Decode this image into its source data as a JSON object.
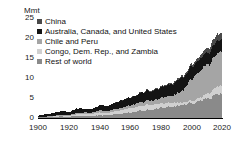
{
  "chart_data": {
    "type": "area",
    "stacked": true,
    "title": "",
    "subtitle": "",
    "xlabel": "",
    "ylabel": "Mmt",
    "unit_label": "Mmt",
    "grid": false,
    "legend_position": "top-left",
    "xlim": [
      1900,
      2020
    ],
    "ylim": [
      0,
      25
    ],
    "xticks": [
      "1900",
      "1920",
      "1940",
      "1960",
      "1980",
      "2000",
      "2020"
    ],
    "yticks": [
      "0",
      "5",
      "10",
      "15",
      "20",
      "25"
    ],
    "x": [
      1900,
      1905,
      1910,
      1915,
      1920,
      1925,
      1930,
      1935,
      1940,
      1945,
      1950,
      1955,
      1960,
      1965,
      1970,
      1975,
      1980,
      1985,
      1990,
      1995,
      2000,
      2005,
      2010,
      2015,
      2018,
      2020
    ],
    "series": [
      {
        "name": "Rest of world",
        "color": "#8a8a8a",
        "values": [
          0.15,
          0.2,
          0.3,
          0.35,
          0.3,
          0.45,
          0.5,
          0.5,
          0.7,
          0.6,
          0.9,
          1.1,
          1.3,
          1.6,
          1.9,
          2.1,
          2.4,
          2.6,
          2.9,
          3.2,
          3.6,
          4.0,
          4.6,
          5.3,
          5.7,
          5.8
        ]
      },
      {
        "name": "Congo, Dem. Rep., and Zambia",
        "color": "#d0d0d0",
        "values": [
          0.0,
          0.02,
          0.05,
          0.1,
          0.2,
          0.35,
          0.5,
          0.45,
          0.6,
          0.55,
          0.7,
          0.85,
          1.0,
          1.1,
          1.25,
          1.2,
          1.1,
          1.05,
          0.9,
          0.6,
          0.55,
          0.7,
          1.1,
          1.6,
          1.9,
          2.0
        ]
      },
      {
        "name": "Chile and Peru",
        "color": "#a5a5a5",
        "values": [
          0.05,
          0.1,
          0.15,
          0.3,
          0.25,
          0.35,
          0.35,
          0.3,
          0.55,
          0.5,
          0.5,
          0.6,
          0.7,
          0.8,
          0.95,
          1.0,
          1.25,
          1.6,
          2.0,
          3.0,
          5.3,
          6.4,
          6.9,
          7.8,
          8.2,
          8.1
        ]
      },
      {
        "name": "Australia, Canada, and United States",
        "color": "#141414",
        "values": [
          0.35,
          0.55,
          0.65,
          0.95,
          0.7,
          1.05,
          0.95,
          0.8,
          1.3,
          1.15,
          1.5,
          1.75,
          1.85,
          2.05,
          2.5,
          2.35,
          2.45,
          2.6,
          3.0,
          2.95,
          3.1,
          2.9,
          2.8,
          3.0,
          3.1,
          3.0
        ]
      },
      {
        "name": "China",
        "color": "#4a4a4a",
        "values": [
          0.0,
          0.0,
          0.0,
          0.0,
          0.0,
          0.0,
          0.0,
          0.0,
          0.0,
          0.0,
          0.02,
          0.05,
          0.1,
          0.12,
          0.15,
          0.2,
          0.25,
          0.3,
          0.35,
          0.43,
          0.59,
          0.76,
          1.2,
          1.7,
          1.6,
          1.7
        ]
      }
    ],
    "totals": [
      0.55,
      0.87,
      1.15,
      1.7,
      1.45,
      2.2,
      2.3,
      2.05,
      3.15,
      2.8,
      3.62,
      4.35,
      4.95,
      5.67,
      6.75,
      6.85,
      7.45,
      8.15,
      9.15,
      10.18,
      13.14,
      14.76,
      16.6,
      19.4,
      20.5,
      20.6
    ]
  },
  "axis": {
    "unit": "Mmt",
    "y_ticks": [
      "25",
      "20",
      "15",
      "10",
      "5",
      "0"
    ],
    "x_ticks": [
      "1900",
      "1920",
      "1940",
      "1960",
      "1980",
      "2000",
      "2020"
    ]
  },
  "legend": {
    "items": [
      {
        "label": "China",
        "color": "#4a4a4a"
      },
      {
        "label": "Australia, Canada, and United States",
        "color": "#141414"
      },
      {
        "label": "Chile and Peru",
        "color": "#a5a5a5"
      },
      {
        "label": "Congo, Dem. Rep., and Zambia",
        "color": "#d0d0d0"
      },
      {
        "label": "Rest of world",
        "color": "#8a8a8a"
      }
    ]
  }
}
